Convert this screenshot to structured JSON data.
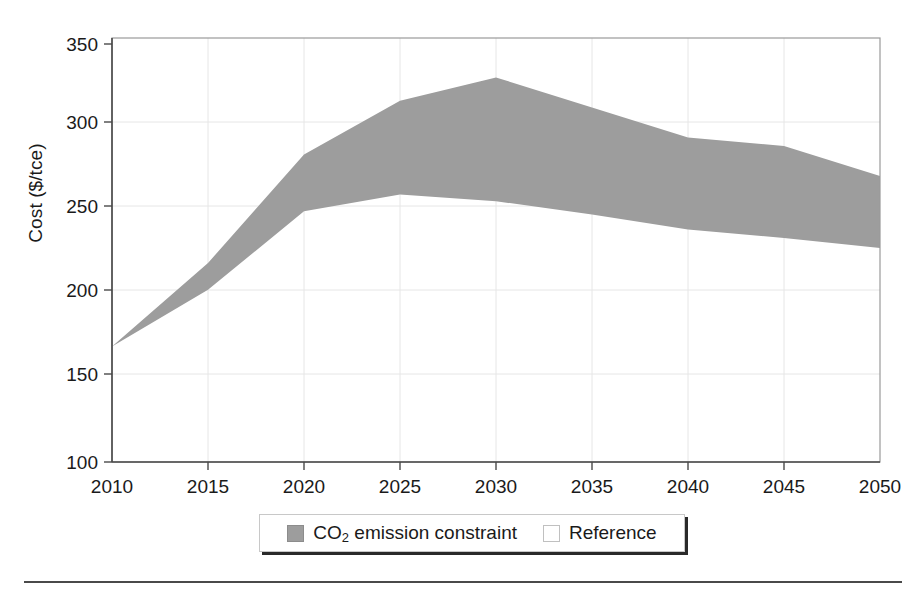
{
  "figure": {
    "background_color": "#ffffff",
    "band_color": "#9d9d9d",
    "axis_color": "#4a4a4a",
    "grid_color": "#e3e3e3"
  },
  "axis": {
    "y_label_prefix": "Cost ($/tce",
    "y_label": "Cost ($/tce)",
    "y_ticks": [
      "350",
      "300",
      "250",
      "200",
      "150",
      "100"
    ],
    "x_ticks": [
      "2010",
      "2015",
      "2020",
      "2025",
      "2030",
      "2035",
      "2040",
      "2045",
      "2050"
    ]
  },
  "legend": {
    "entries": [
      {
        "label_lead": "CO",
        "label_sub": "2",
        "label_tail": " emission constraint",
        "swatch": "filled-square-icon",
        "color": "#9d9d9d"
      },
      {
        "label_lead": "Reference",
        "label_sub": "",
        "label_tail": "",
        "swatch": "hollow-square-icon",
        "color": "#ffffff"
      }
    ]
  },
  "chart_data": {
    "type": "area",
    "title": "",
    "xlabel": "",
    "ylabel": "Cost ($/tce)",
    "xlim": [
      2010,
      2050
    ],
    "ylim": [
      100,
      350
    ],
    "grid": true,
    "legend_position": "bottom-center",
    "x": [
      2010,
      2015,
      2020,
      2025,
      2030,
      2035,
      2040,
      2045,
      2050
    ],
    "series": [
      {
        "name": "CO2 emission constraint",
        "role": "band-upper",
        "values": [
          169,
          219,
          284,
          316,
          330,
          312,
          294,
          289,
          271
        ]
      },
      {
        "name": "Reference",
        "role": "band-lower",
        "values": [
          169,
          203,
          250,
          260,
          256,
          248,
          239,
          234,
          228
        ]
      }
    ],
    "band_fill": "#9d9d9d"
  }
}
